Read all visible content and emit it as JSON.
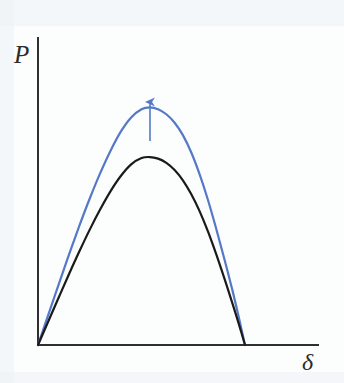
{
  "figure": {
    "background_color": "#fcfdfd",
    "width": 344,
    "height": 383,
    "axes": {
      "origin": [
        38,
        345
      ],
      "y_axis_top": [
        38,
        38
      ],
      "x_axis_right": [
        318,
        345
      ],
      "color": "#2e2e33",
      "y_label": "P",
      "x_label": "δ"
    },
    "annotation": {
      "arrow_name": "upward-shift-arrow",
      "arrow_color": "#5578c8",
      "arrow_x": 150,
      "arrow_tail_y": 141,
      "arrow_tip_y": 102
    }
  },
  "chart_data": {
    "type": "line",
    "title": "",
    "xlabel": "δ",
    "ylabel": "P",
    "grid": false,
    "legend": null,
    "xlim": [
      0,
      1.0
    ],
    "ylim": [
      0,
      1.0
    ],
    "annotations": [
      {
        "type": "arrow",
        "direction": "up",
        "x": 0.54,
        "y_start": 0.66,
        "y_end": 0.79,
        "color": "#5578c8",
        "meaning": "upward shift of the curve"
      }
    ],
    "series": [
      {
        "name": "upper-curve",
        "color": "#5578c8",
        "linewidth": 2.2,
        "x": [
          0.0,
          0.05,
          0.1,
          0.15,
          0.2,
          0.25,
          0.3,
          0.35,
          0.4,
          0.45,
          0.5,
          0.54,
          0.58,
          0.62,
          0.66,
          0.7,
          0.74,
          0.78,
          0.82,
          0.86,
          0.9,
          0.94,
          0.97,
          1.0
        ],
        "y": [
          0.0,
          0.115,
          0.23,
          0.343,
          0.452,
          0.555,
          0.65,
          0.735,
          0.808,
          0.862,
          0.893,
          0.9,
          0.893,
          0.874,
          0.842,
          0.795,
          0.73,
          0.648,
          0.552,
          0.443,
          0.327,
          0.205,
          0.105,
          0.0
        ]
      },
      {
        "name": "lower-curve",
        "color": "#1a1a1a",
        "linewidth": 2.2,
        "x": [
          0.0,
          0.05,
          0.1,
          0.15,
          0.2,
          0.25,
          0.3,
          0.35,
          0.4,
          0.45,
          0.5,
          0.54,
          0.58,
          0.62,
          0.66,
          0.7,
          0.74,
          0.78,
          0.82,
          0.86,
          0.9,
          0.94,
          0.97,
          1.0
        ],
        "y": [
          0.0,
          0.09,
          0.18,
          0.269,
          0.355,
          0.437,
          0.513,
          0.582,
          0.64,
          0.684,
          0.708,
          0.712,
          0.706,
          0.69,
          0.663,
          0.624,
          0.572,
          0.508,
          0.432,
          0.346,
          0.253,
          0.156,
          0.08,
          0.0
        ]
      }
    ]
  }
}
